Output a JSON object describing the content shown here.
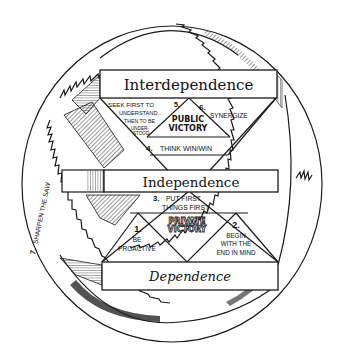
{
  "diagram": {
    "type": "maturity-continuum-saw",
    "levels": {
      "interdependence": "Interdependence",
      "independence": "Independence",
      "dependence": "Dependence"
    },
    "victories": {
      "public": [
        "PUBLIC",
        "VICTORY"
      ],
      "private": [
        "PRIVATE",
        "VICTORY"
      ]
    },
    "habits": {
      "h1": {
        "number": "1.",
        "lines": [
          "BE",
          "PROACTIVE"
        ]
      },
      "h2": {
        "number": "2.",
        "lines": [
          "BEGIN",
          "WITH THE",
          "END IN MIND"
        ]
      },
      "h3": {
        "number": "3.",
        "lines": [
          "PUT FIRST",
          "THINGS FIRST"
        ]
      },
      "h4": {
        "number": "4.",
        "lines": [
          "THINK WIN/WIN"
        ]
      },
      "h5": {
        "number": "5.",
        "lines": [
          "SEEK FIRST TO",
          "UNDERSTAND…",
          "THEN TO BE",
          "UNDER-",
          "STOOD"
        ]
      },
      "h6": {
        "number": "6.",
        "lines": [
          "SYNERGIZE"
        ]
      },
      "h7": {
        "number": "7.",
        "lines": [
          "SHARPEN THE SAW"
        ]
      }
    },
    "colors": {
      "ink": "#1a1a1a",
      "background": "#ffffff"
    }
  }
}
